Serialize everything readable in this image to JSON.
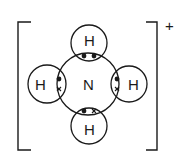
{
  "diagram": {
    "charge": "+",
    "central_atom": {
      "symbol": "N",
      "cx": 88,
      "cy": 84,
      "r": 31
    },
    "hydrogens": [
      {
        "position": "top",
        "symbol": "H",
        "cx": 89,
        "cy": 43,
        "r": 18,
        "electrons": [
          "dot",
          "dot"
        ]
      },
      {
        "position": "left",
        "symbol": "H",
        "cx": 47,
        "cy": 84,
        "r": 19,
        "electrons": [
          "dot",
          "cross"
        ]
      },
      {
        "position": "right",
        "symbol": "H",
        "cx": 129,
        "cy": 84,
        "r": 18,
        "electrons": [
          "dot",
          "cross"
        ]
      },
      {
        "position": "bottom",
        "symbol": "H",
        "cx": 89,
        "cy": 126,
        "r": 18,
        "electrons": [
          "dot",
          "cross"
        ]
      }
    ],
    "colors": {
      "stroke": "#1a1a1a",
      "background": "#ffffff"
    }
  }
}
